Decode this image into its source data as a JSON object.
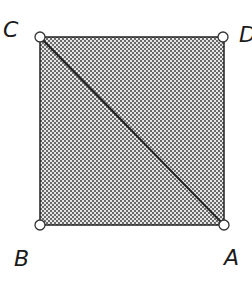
{
  "diagram": {
    "shape": "square",
    "fill_pattern": "crosshatch",
    "colors": {
      "stroke": "#222222",
      "fill_dark": "#6a6a6a",
      "fill_light": "#e6e6e6",
      "vertex_fill": "#ffffff"
    },
    "vertices": [
      {
        "label": "A",
        "position": "bottom-right"
      },
      {
        "label": "B",
        "position": "bottom-left"
      },
      {
        "label": "C",
        "position": "top-left"
      },
      {
        "label": "D",
        "position": "top-right"
      }
    ],
    "diagonal": {
      "from": "C",
      "to": "A"
    }
  }
}
